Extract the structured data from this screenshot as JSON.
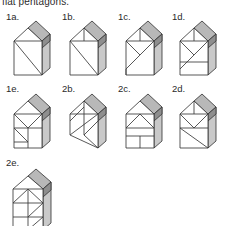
{
  "page": {
    "caption": "flat pentagons.",
    "background_color": "#ffffff",
    "line_color": "#3a3a3a",
    "face_color": "#ffffff",
    "slab_light": "#cfcfcf",
    "slab_dark": "#8e8e8e",
    "slab_mid": "#b5b5b5"
  },
  "figures": [
    {
      "id": "1a",
      "label": "1a.",
      "x": 6,
      "y": 12,
      "shape": "house-pentagon",
      "cuts": [
        "diagonal-square-tl-br",
        "roof-left-edge"
      ],
      "description": "Pentagon house with square base crossed by one diagonal and a plain triangular roof."
    },
    {
      "id": "1b",
      "label": "1b.",
      "x": 62,
      "y": 12,
      "shape": "house-pentagon",
      "cuts": [
        "roof-vertical-altitude",
        "diagonal-square-tl-br"
      ],
      "description": "Roof triangle split by a vertical altitude; square base crossed by one diagonal."
    },
    {
      "id": "1c",
      "label": "1c.",
      "x": 118,
      "y": 12,
      "shape": "house-pentagon",
      "cuts": [
        "roof-vertical-altitude",
        "square-v-from-top-corners",
        "diagonal-square-tl-br"
      ],
      "description": "Roof with vertical altitude; base with a V meeting at the bottom mid plus a long diagonal."
    },
    {
      "id": "1d",
      "label": "1d.",
      "x": 172,
      "y": 12,
      "shape": "house-pentagon",
      "cuts": [
        "square-v-from-top-corners",
        "horizontal-mid-band",
        "diagonal-square-tl-br"
      ],
      "description": "Base split by a V and a horizontal band near the bottom, plus a diagonal."
    },
    {
      "id": "1e",
      "label": "1e.",
      "x": 6,
      "y": 84,
      "shape": "house-pentagon",
      "cuts": [
        "square-quadrants",
        "diagonal-square-tl-br",
        "diagonal-lower-left"
      ],
      "description": "Base divided into four quadrants with extra diagonals in the lower-left quadrant."
    },
    {
      "id": "2b",
      "label": "2b.",
      "x": 62,
      "y": 84,
      "shape": "rhombus-slab",
      "cuts": [
        "rhombus-vertical-mid",
        "rhombus-long-diagonal",
        "parallel-diagonals"
      ],
      "description": "Leaning rhombus prism split by a vertical mid line and parallel diagonals."
    },
    {
      "id": "2c",
      "label": "2c.",
      "x": 118,
      "y": 84,
      "shape": "house-pentagon",
      "cuts": [
        "roof-wide-triangle",
        "square-horizontal-mid",
        "square-vertical-mid"
      ],
      "description": "Wide triangular gable over a base split into a horizontal band and vertical mid line."
    },
    {
      "id": "2d",
      "label": "2d.",
      "x": 172,
      "y": 84,
      "shape": "house-pentagon",
      "cuts": [
        "roof-vertical-altitude",
        "square-v-from-top-corners",
        "diagonal-square-tl-br"
      ],
      "description": "Roof with vertical altitude; base with V cut and a full diagonal."
    },
    {
      "id": "2e",
      "label": "2e.",
      "x": 6,
      "y": 158,
      "shape": "house-pentagon",
      "cuts": [
        "roof-double-gable",
        "square-horizontal-mid",
        "square-vertical-mid",
        "diagonal-lower-right"
      ],
      "description": "Tall pentagon with double gable lines, a mid horizontal, a mid vertical and a lower diagonal."
    }
  ]
}
